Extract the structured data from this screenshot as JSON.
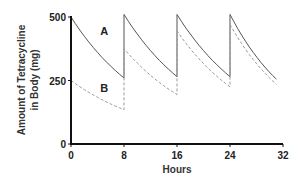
{
  "chart_data": {
    "type": "line",
    "title": "",
    "xlabel": "Hours",
    "ylabel": "Amount of Tetracycline in Body (mg)",
    "ylabel_lines": [
      "Amount of Tetracycline",
      "in Body (mg)"
    ],
    "xlim": [
      0,
      32
    ],
    "ylim": [
      0,
      500
    ],
    "x_ticks": [
      0,
      8,
      16,
      24,
      32
    ],
    "y_ticks": [
      0,
      250,
      500
    ],
    "grid": false,
    "legend": "inline labels",
    "series": [
      {
        "name": "A",
        "style": "solid",
        "color": "#555555",
        "points": [
          [
            0,
            500
          ],
          [
            8,
            260
          ],
          [
            8,
            510
          ],
          [
            16,
            265
          ],
          [
            16,
            510
          ],
          [
            24,
            265
          ],
          [
            24,
            510
          ],
          [
            31,
            255
          ]
        ]
      },
      {
        "name": "B",
        "style": "dashed",
        "color": "#9a9a9a",
        "points": [
          [
            0,
            250
          ],
          [
            8,
            135
          ],
          [
            8,
            375
          ],
          [
            16,
            195
          ],
          [
            16,
            445
          ],
          [
            24,
            225
          ],
          [
            24,
            470
          ],
          [
            31,
            235
          ]
        ]
      }
    ],
    "annotations": [
      {
        "text": "A",
        "x": 5,
        "y": 430
      },
      {
        "text": "B",
        "x": 5,
        "y": 205
      }
    ]
  }
}
